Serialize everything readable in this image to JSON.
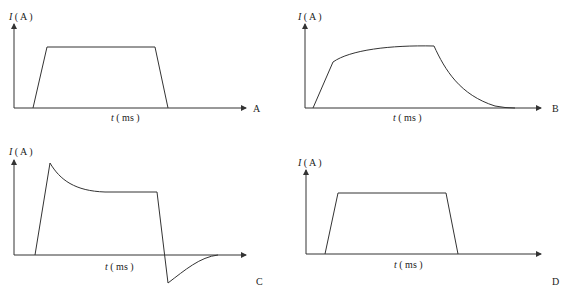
{
  "panels": [
    {
      "id": "A",
      "letter": "A",
      "ylabel_var": "I",
      "ylabel_unit": "( A )",
      "xlabel_var": "t",
      "xlabel_unit": "( ms )",
      "shape": "trapezoid"
    },
    {
      "id": "B",
      "letter": "B",
      "ylabel_var": "I",
      "ylabel_unit": "( A )",
      "xlabel_var": "t",
      "xlabel_unit": "( ms )",
      "shape": "exponential rise and decay"
    },
    {
      "id": "C",
      "letter": "C",
      "ylabel_var": "I",
      "ylabel_unit": "( A )",
      "xlabel_var": "t",
      "xlabel_unit": "( ms )",
      "shape": "overshoot spike, plateau, negative undershoot"
    },
    {
      "id": "D",
      "letter": "D",
      "ylabel_var": "I",
      "ylabel_unit": "( A )",
      "xlabel_var": "t",
      "xlabel_unit": "( ms )",
      "shape": "trapezoid"
    }
  ],
  "colors": {
    "line": "#333333",
    "background": "#ffffff"
  }
}
